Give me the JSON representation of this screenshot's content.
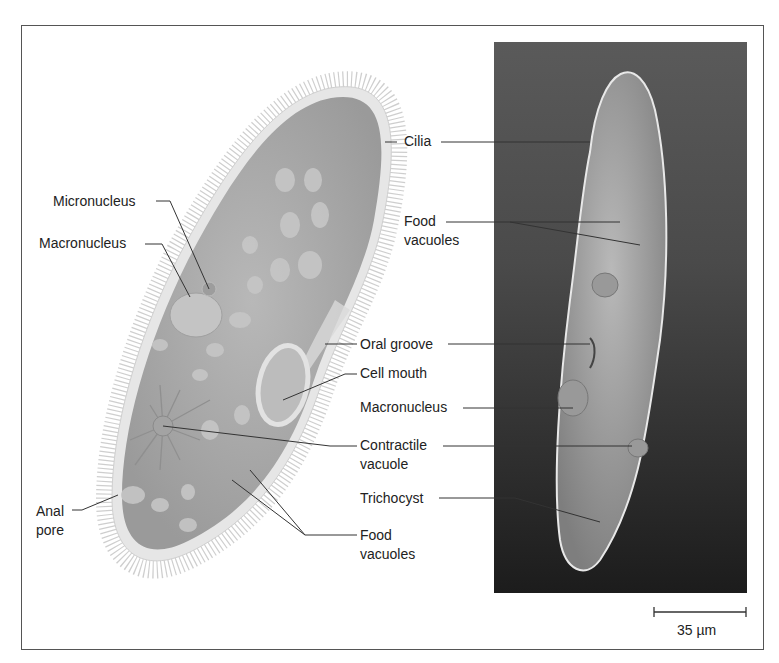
{
  "figure": {
    "illustration_labels": {
      "micronucleus": "Micronucleus",
      "macronucleus": "Macronucleus",
      "anal_pore_line1": "Anal",
      "anal_pore_line2": "pore"
    },
    "shared_labels": {
      "cilia": "Cilia",
      "oral_groove": "Oral groove",
      "cell_mouth": "Cell mouth",
      "contractile_vacuole_line1": "Contractile",
      "contractile_vacuole_line2": "vacuole",
      "food_vacuoles_bottom_line1": "Food",
      "food_vacuoles_bottom_line2": "vacuoles"
    },
    "photo_labels": {
      "food_vacuoles_line1": "Food",
      "food_vacuoles_line2": "vacuoles",
      "macronucleus": "Macronucleus",
      "trichocyst": "Trichocyst"
    },
    "scale_bar": {
      "label": "35 µm"
    },
    "colors": {
      "frame": "#555555",
      "cell_fill": "#a9a9a9",
      "cell_membrane": "#e4e4e4",
      "photo_bg": "#4a4a4a",
      "leader_line": "#333333"
    }
  }
}
